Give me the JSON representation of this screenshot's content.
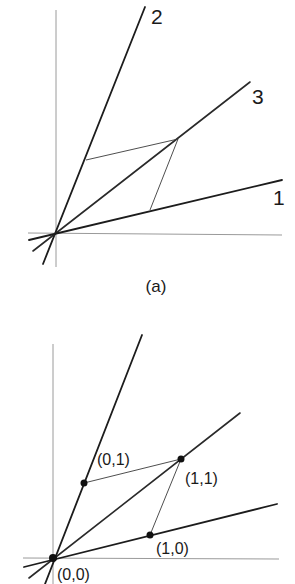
{
  "figure": {
    "panel_a": {
      "caption": "(a)",
      "ray_labels": {
        "ray1": "1",
        "ray2": "2",
        "ray3": "3"
      }
    },
    "panel_b": {
      "point_labels": {
        "origin": "(0,0)",
        "p01": "(0,1)",
        "p11": "(1,1)",
        "p10": "(1,0)"
      }
    },
    "colors": {
      "background": "#ffffff",
      "ink": "#1c1c1c",
      "axis": "#9a9a9a"
    }
  }
}
